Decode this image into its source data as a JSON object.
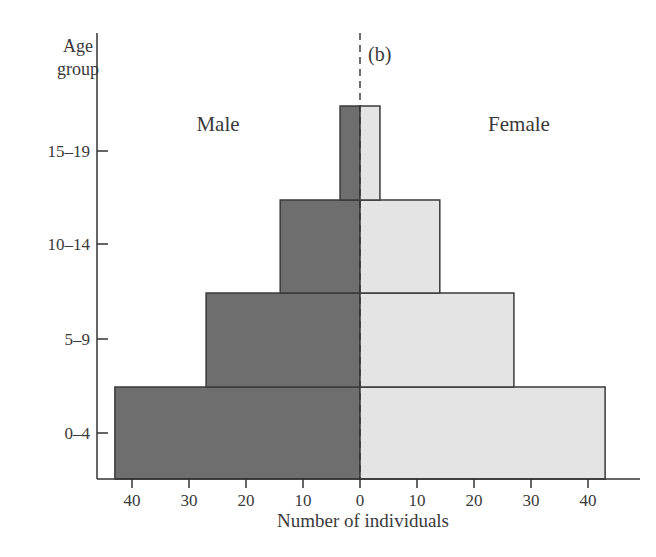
{
  "chart_data": {
    "type": "bar",
    "subtype": "population-pyramid",
    "panel_label": "(b)",
    "title": "",
    "ylabel": "Age group",
    "xlabel": "Number of individuals",
    "categories": [
      "0–4",
      "5–9",
      "10–14",
      "15–19"
    ],
    "series": [
      {
        "name": "Male",
        "side": "left",
        "color": "#6e6e6e",
        "values": [
          43,
          27,
          14,
          3.5
        ]
      },
      {
        "name": "Female",
        "side": "right",
        "color": "#e4e4e4",
        "values": [
          43,
          27,
          14,
          3.5
        ]
      }
    ],
    "xticks": {
      "left": [
        "40",
        "30",
        "20",
        "10",
        "0"
      ],
      "right": [
        "10",
        "20",
        "30",
        "40"
      ]
    },
    "xlim": [
      -45,
      45
    ],
    "grid": false,
    "legend": "inline labels: Male (left), Female (right)",
    "center_line": "dashed vertical at 0"
  },
  "labels": {
    "ylabel_line1": "Age",
    "ylabel_line2": "group",
    "xlabel": "Number of individuals",
    "panel": "(b)",
    "male": "Male",
    "female": "Female"
  }
}
